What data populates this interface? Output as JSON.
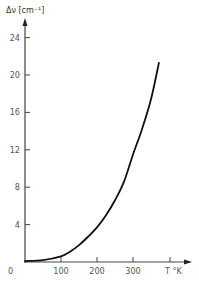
{
  "chart_data": {
    "type": "line",
    "title": "",
    "xlabel": "T °K",
    "ylabel": "Δν [cm⁻¹]",
    "xlim": [
      0,
      400
    ],
    "ylim": [
      0,
      26
    ],
    "x_ticks": [
      0,
      100,
      200,
      300
    ],
    "y_ticks": [
      4,
      8,
      12,
      16,
      20,
      24
    ],
    "grid": false,
    "legend": null,
    "series": [
      {
        "name": "Δν vs T",
        "x": [
          0,
          50,
          100,
          125,
          150,
          175,
          200,
          225,
          250,
          275,
          300,
          325,
          350,
          372
        ],
        "y": [
          0.1,
          0.2,
          0.6,
          1.1,
          1.8,
          2.7,
          3.7,
          5.0,
          6.6,
          8.6,
          11.5,
          14.2,
          17.4,
          21.3
        ]
      }
    ]
  },
  "labels": {
    "y_axis_title": "Δν [cm⁻¹]",
    "x_axis_title": "T °K",
    "x_tick_labels": [
      "0",
      "100",
      "200",
      "300"
    ],
    "y_tick_labels": [
      "4",
      "8",
      "12",
      "16",
      "20",
      "24"
    ]
  }
}
